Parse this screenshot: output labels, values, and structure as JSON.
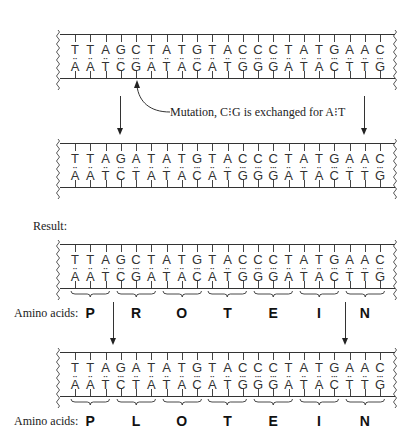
{
  "diagram": {
    "strands": {
      "original": {
        "top": [
          "T",
          "T",
          "A",
          "G",
          "C",
          "T",
          "A",
          "T",
          "G",
          "T",
          "A",
          "C",
          "C",
          "C",
          "T",
          "A",
          "T",
          "G",
          "A",
          "A",
          "C"
        ],
        "bottom": [
          "A",
          "A",
          "T",
          "C",
          "G",
          "A",
          "T",
          "A",
          "C",
          "A",
          "T",
          "G",
          "G",
          "G",
          "A",
          "T",
          "A",
          "C",
          "T",
          "T",
          "G"
        ]
      },
      "mutated": {
        "top": [
          "T",
          "T",
          "A",
          "G",
          "A",
          "T",
          "A",
          "T",
          "G",
          "T",
          "A",
          "C",
          "C",
          "C",
          "T",
          "A",
          "T",
          "G",
          "A",
          "A",
          "C"
        ],
        "bottom": [
          "A",
          "A",
          "T",
          "C",
          "T",
          "A",
          "T",
          "A",
          "C",
          "A",
          "T",
          "G",
          "G",
          "G",
          "A",
          "T",
          "A",
          "C",
          "T",
          "T",
          "G"
        ]
      }
    },
    "mutation_caption": {
      "prefix": "Mutation,",
      "from": "C",
      "pair_sep": "⁝",
      "from2": "G",
      "middle": "is exchanged for",
      "to": "A",
      "to2": "T",
      "full": "Mutation, C⁝G is exchanged for A⁝T"
    },
    "result_label": "Result:",
    "amino_acids_label": "Amino acids:",
    "amino_acids_original": [
      "P",
      "R",
      "O",
      "T",
      "E",
      "I",
      "N"
    ],
    "amino_acids_mutated": [
      "P",
      "L",
      "O",
      "T",
      "E",
      "I",
      "N"
    ],
    "colors": {
      "ink": "#222222",
      "background": "#ffffff"
    }
  }
}
